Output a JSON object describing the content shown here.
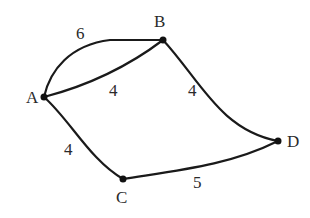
{
  "graph": {
    "nodes": [
      {
        "id": "A",
        "label": "A",
        "x": 44,
        "y": 97,
        "lx": 26,
        "ly": 103
      },
      {
        "id": "B",
        "label": "B",
        "x": 163,
        "y": 40,
        "lx": 154,
        "ly": 27
      },
      {
        "id": "C",
        "label": "C",
        "x": 123,
        "y": 179,
        "lx": 116,
        "ly": 203
      },
      {
        "id": "D",
        "label": "D",
        "x": 278,
        "y": 141,
        "lx": 287,
        "ly": 147
      }
    ],
    "edges": [
      {
        "from": "A",
        "to": "B",
        "weight": "6",
        "path": "M44,97 C50,70 70,45 110,40 L163,40",
        "lx": 76,
        "ly": 39
      },
      {
        "from": "A",
        "to": "B",
        "weight": "4",
        "path": "M44,97 C90,85 130,65 163,40",
        "lx": 109,
        "ly": 96
      },
      {
        "from": "B",
        "to": "D",
        "weight": "4",
        "path": "M163,40 C200,80 220,130 278,141",
        "lx": 188,
        "ly": 96
      },
      {
        "from": "A",
        "to": "C",
        "weight": "4",
        "path": "M44,97 C70,120 90,160 123,179",
        "lx": 64,
        "ly": 155
      },
      {
        "from": "C",
        "to": "D",
        "weight": "5",
        "path": "M123,179 C180,170 230,165 278,141",
        "lx": 193,
        "ly": 188
      }
    ]
  }
}
